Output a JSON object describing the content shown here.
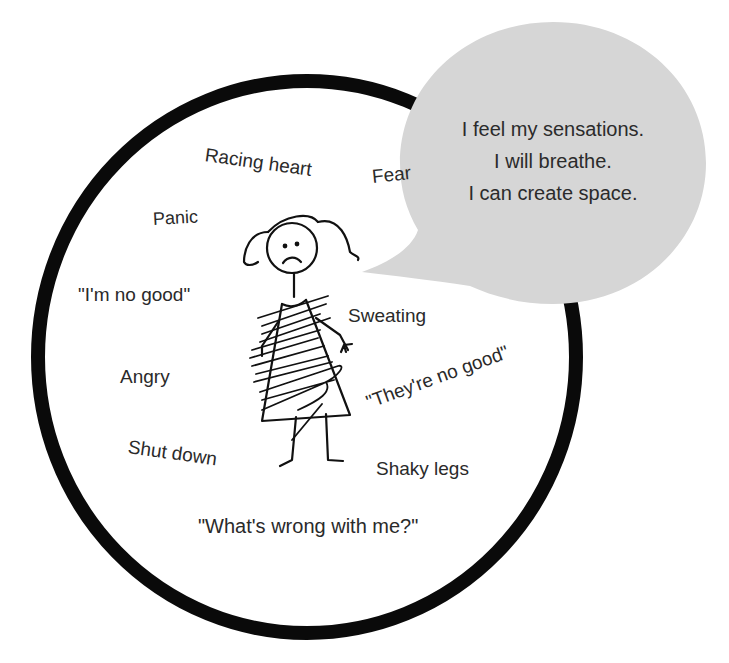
{
  "diagram": {
    "title": "",
    "circle": {
      "stroke": "#0a0a0a",
      "fill": "#ffffff"
    },
    "bubble": {
      "fill": "#d6d6d6",
      "lines": [
        "I feel my sensations.",
        "I will breathe.",
        "I can create space."
      ]
    },
    "figure": {
      "description": "stick figure girl with pigtails and frown, scribbled dress"
    },
    "labels": {
      "racing_heart": "Racing heart",
      "fear": "Fear",
      "panic": "Panic",
      "im_no_good": "\"I'm no good\"",
      "sweating": "Sweating",
      "angry": "Angry",
      "theyre_no_good": "\"They're no good\"",
      "shut_down": "Shut down",
      "shaky_legs": "Shaky legs",
      "whats_wrong": "\"What's wrong with me?\""
    }
  }
}
